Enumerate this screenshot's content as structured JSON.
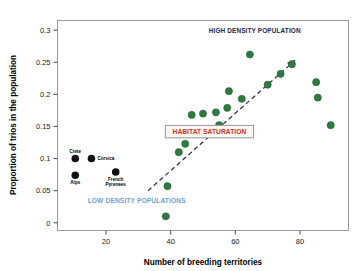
{
  "chart_data": {
    "type": "scatter",
    "title": "",
    "xlabel": "Number of breeding territories",
    "ylabel": "Proportion of trios in the population",
    "xlim": [
      5,
      95
    ],
    "ylim": [
      -0.012,
      0.315
    ],
    "xticks": [
      20,
      40,
      60,
      80
    ],
    "xtick_labels": [
      "20",
      "40",
      "60",
      "80"
    ],
    "yticks": [
      0,
      0.05,
      0.1,
      0.15,
      0.2,
      0.25,
      0.3
    ],
    "ytick_labels": [
      "0",
      "0.05",
      "0.1",
      "0.15",
      "0.2",
      "0.25",
      "0.3"
    ],
    "grid": false,
    "legend": "none",
    "frame": true,
    "series": [
      {
        "name": "Low density populations (labelled)",
        "marker": "circle",
        "color": "#111111",
        "points": [
          {
            "x": 10.5,
            "y": 0.1,
            "label": "Crete",
            "label_pos": "above"
          },
          {
            "x": 15.5,
            "y": 0.1,
            "label": "Corsica",
            "label_pos": "right"
          },
          {
            "x": 10.5,
            "y": 0.074,
            "label": "Alps",
            "label_pos": "below"
          },
          {
            "x": 23.0,
            "y": 0.079,
            "label": "French Pyrenees",
            "label_pos": "below"
          }
        ]
      },
      {
        "name": "High density populations",
        "marker": "circle",
        "color": "#2f7a3f",
        "points": [
          {
            "x": 38.5,
            "y": 0.01
          },
          {
            "x": 39.0,
            "y": 0.057
          },
          {
            "x": 42.5,
            "y": 0.11
          },
          {
            "x": 44.5,
            "y": 0.123
          },
          {
            "x": 46.5,
            "y": 0.168
          },
          {
            "x": 50.0,
            "y": 0.17
          },
          {
            "x": 54.0,
            "y": 0.172
          },
          {
            "x": 55.0,
            "y": 0.152
          },
          {
            "x": 57.5,
            "y": 0.179
          },
          {
            "x": 58.0,
            "y": 0.205
          },
          {
            "x": 62.0,
            "y": 0.193
          },
          {
            "x": 64.5,
            "y": 0.262
          },
          {
            "x": 70.0,
            "y": 0.215
          },
          {
            "x": 74.0,
            "y": 0.232
          },
          {
            "x": 77.5,
            "y": 0.247
          },
          {
            "x": 85.0,
            "y": 0.219
          },
          {
            "x": 85.5,
            "y": 0.195
          },
          {
            "x": 89.5,
            "y": 0.152
          }
        ]
      }
    ],
    "trend": {
      "style": "dashed",
      "color": "#3a3350",
      "arrow": true,
      "x_start": 33.0,
      "y_start": 0.05,
      "x_end": 78.5,
      "y_end": 0.253
    },
    "annotations": [
      {
        "id": "high-density",
        "text": "HIGH DENSITY POPULATION",
        "x": 66.0,
        "y": 0.3,
        "color": "#1b2a52",
        "boxed": false
      },
      {
        "id": "low-density",
        "text": "LOW DENSITY POPULATIONS",
        "x": 29.5,
        "y": 0.034,
        "color": "#6f9fd0",
        "boxed": false
      },
      {
        "id": "habitat-saturation",
        "text": "HABITAT SATURATION",
        "x": 52.0,
        "y": 0.142,
        "color": "#cc3322",
        "boxed": true,
        "box_fill": "#fdf6f2",
        "box_stroke": "#8d8d8d"
      }
    ]
  },
  "figure": {
    "background": "#ffffff",
    "frame_color": "#9a9a9a",
    "tick_color": "#4a4a4a",
    "marker_green": "#2f7a3f",
    "marker_black": "#111111",
    "trend_color": "#3a3350"
  }
}
